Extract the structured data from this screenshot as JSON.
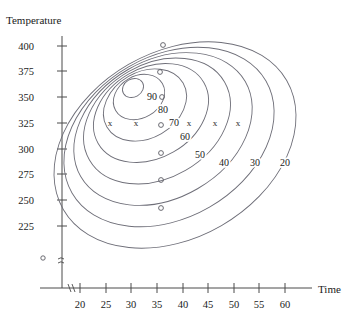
{
  "chart_data": {
    "type": "contour",
    "title": "",
    "xlabel": "Time",
    "ylabel": "Temperature",
    "xticks": [
      20,
      25,
      30,
      35,
      40,
      45,
      50,
      55,
      60
    ],
    "yticks": [
      225,
      250,
      275,
      325,
      300,
      350,
      375,
      400
    ],
    "ytick_labels": [
      "400",
      "375",
      "350",
      "325",
      "300",
      "275",
      "250",
      "225"
    ],
    "xtick_labels": [
      "20",
      "25",
      "30",
      "35",
      "40",
      "45",
      "50",
      "55",
      "60"
    ],
    "xlim": [
      16,
      63
    ],
    "ylim": [
      205,
      410
    ],
    "axis_break_x": true,
    "axis_break_y": true,
    "grid": false,
    "legend": "none",
    "contour_labels": [
      "90",
      "80",
      "70",
      "60",
      "50",
      "40",
      "30",
      "20"
    ],
    "contour_levels": [
      90,
      80,
      70,
      60,
      50,
      40,
      30,
      20
    ],
    "contours": [
      {
        "label": "90",
        "cx": 133,
        "cy": 88,
        "rx": 11,
        "ry": 9,
        "rot": -30
      },
      {
        "label": "80",
        "cx": 139,
        "cy": 97,
        "rx": 27,
        "ry": 21,
        "rot": -30
      },
      {
        "label": "70",
        "cx": 145,
        "cy": 105,
        "rx": 44,
        "ry": 33,
        "rot": -30
      },
      {
        "label": "60",
        "cx": 151,
        "cy": 113,
        "rx": 61,
        "ry": 45,
        "rot": -30
      },
      {
        "label": "50",
        "cx": 157,
        "cy": 121,
        "rx": 78,
        "ry": 57,
        "rot": -30
      },
      {
        "label": "40",
        "cx": 163,
        "cy": 129,
        "rx": 95,
        "ry": 69,
        "rot": -30
      },
      {
        "label": "30",
        "cx": 169,
        "cy": 137,
        "rx": 112,
        "ry": 81,
        "rot": -30
      },
      {
        "label": "20",
        "cx": 175,
        "cy": 145,
        "rx": 129,
        "ry": 93,
        "rot": -30
      }
    ],
    "contour_label_positions": [
      {
        "text": "90",
        "x": 152,
        "y": 100
      },
      {
        "text": "80",
        "x": 163,
        "y": 113
      },
      {
        "text": "70",
        "x": 174,
        "y": 126
      },
      {
        "text": "60",
        "x": 185,
        "y": 140
      },
      {
        "text": "50",
        "x": 200,
        "y": 158
      },
      {
        "text": "40",
        "x": 224,
        "y": 166
      },
      {
        "text": "30",
        "x": 255,
        "y": 166
      },
      {
        "text": "20",
        "x": 285,
        "y": 166
      }
    ],
    "x_markers": [
      {
        "x": 110,
        "y": 126
      },
      {
        "x": 136,
        "y": 126
      },
      {
        "x": 189,
        "y": 126
      },
      {
        "x": 215,
        "y": 126
      },
      {
        "x": 238,
        "y": 126
      }
    ],
    "data_points": [
      {
        "x": 163,
        "y": 45
      },
      {
        "x": 160,
        "y": 72
      },
      {
        "x": 162,
        "y": 97
      },
      {
        "x": 161,
        "y": 125
      },
      {
        "x": 161,
        "y": 153
      },
      {
        "x": 161,
        "y": 180
      },
      {
        "x": 161,
        "y": 208
      }
    ],
    "origin_marker": {
      "x": 43,
      "y": 258
    }
  }
}
